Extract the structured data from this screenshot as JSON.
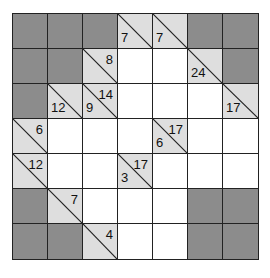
{
  "puzzle": {
    "type": "kakuro",
    "rows": 7,
    "cols": 7,
    "colors": {
      "block": "#8c8c8c",
      "clue": "#dedede",
      "empty": "#ffffff",
      "line": "#222222"
    },
    "cells": [
      [
        {
          "t": "B"
        },
        {
          "t": "B"
        },
        {
          "t": "B"
        },
        {
          "t": "C",
          "down": "7"
        },
        {
          "t": "C",
          "down": "7"
        },
        {
          "t": "B"
        },
        {
          "t": "B"
        }
      ],
      [
        {
          "t": "B"
        },
        {
          "t": "B"
        },
        {
          "t": "C",
          "right": "8"
        },
        {
          "t": "W"
        },
        {
          "t": "W"
        },
        {
          "t": "C",
          "down": "24"
        },
        {
          "t": "B"
        }
      ],
      [
        {
          "t": "B"
        },
        {
          "t": "C",
          "down": "12"
        },
        {
          "t": "C",
          "down": "9",
          "right": "14"
        },
        {
          "t": "W"
        },
        {
          "t": "W"
        },
        {
          "t": "W"
        },
        {
          "t": "C",
          "down": "17"
        }
      ],
      [
        {
          "t": "C",
          "right": "6"
        },
        {
          "t": "W"
        },
        {
          "t": "W"
        },
        {
          "t": "W"
        },
        {
          "t": "C",
          "down": "6",
          "right": "17"
        },
        {
          "t": "W"
        },
        {
          "t": "W"
        }
      ],
      [
        {
          "t": "C",
          "right": "12"
        },
        {
          "t": "W"
        },
        {
          "t": "W"
        },
        {
          "t": "C",
          "down": "3",
          "right": "17"
        },
        {
          "t": "W"
        },
        {
          "t": "W"
        },
        {
          "t": "W"
        }
      ],
      [
        {
          "t": "B"
        },
        {
          "t": "C",
          "right": "7"
        },
        {
          "t": "W"
        },
        {
          "t": "W"
        },
        {
          "t": "W"
        },
        {
          "t": "B"
        },
        {
          "t": "B"
        }
      ],
      [
        {
          "t": "B"
        },
        {
          "t": "B"
        },
        {
          "t": "C",
          "right": "4"
        },
        {
          "t": "W"
        },
        {
          "t": "W"
        },
        {
          "t": "B"
        },
        {
          "t": "B"
        }
      ]
    ]
  }
}
